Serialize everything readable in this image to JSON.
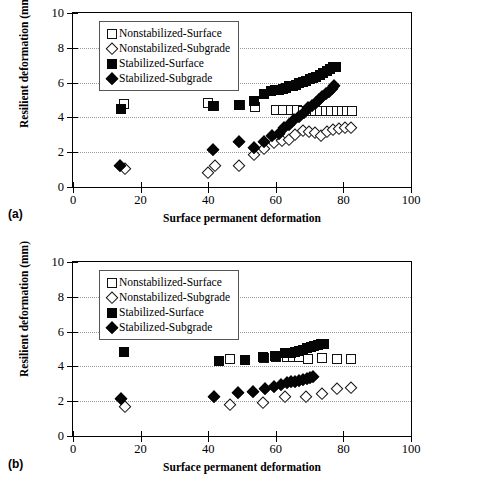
{
  "figure": {
    "panels": [
      {
        "letter": "(a)",
        "xlabel": "Surface permanent deformation",
        "ylabel": "Resilient deformation (mm)",
        "xticks": [
          "0",
          "20",
          "40",
          "60",
          "80",
          "100"
        ],
        "yticks": [
          "0",
          "2",
          "4",
          "6",
          "8",
          "10"
        ],
        "legend": [
          {
            "label": "Nonstabilized-Surface",
            "marker": "open-square-icon"
          },
          {
            "label": "Nonstabilized-Subgrade",
            "marker": "open-diamond-icon"
          },
          {
            "label": "Stabilized-Surface",
            "marker": "filled-square-icon"
          },
          {
            "label": "Stabilized-Subgrade",
            "marker": "filled-diamond-icon"
          }
        ]
      },
      {
        "letter": "(b)",
        "xlabel": "Surface permanent deformation",
        "ylabel": "Resilient deformation (mm)",
        "xticks": [
          "0",
          "20",
          "40",
          "60",
          "80",
          "100"
        ],
        "yticks": [
          "0",
          "2",
          "4",
          "6",
          "8",
          "10"
        ],
        "legend": [
          {
            "label": "Nonstabilized-Surface",
            "marker": "open-square-icon"
          },
          {
            "label": "Nonstabilized-Subgrade",
            "marker": "open-diamond-icon"
          },
          {
            "label": "Stabilized-Surface",
            "marker": "filled-square-icon"
          },
          {
            "label": "Stabilized-Subgrade",
            "marker": "filled-diamond-icon"
          }
        ]
      }
    ]
  },
  "chart_data": [
    {
      "type": "scatter",
      "panel": "(a)",
      "title": "",
      "xlabel": "Surface permanent deformation",
      "ylabel": "Resilient deformation (mm)",
      "xlim": [
        0,
        100
      ],
      "ylim": [
        0,
        10
      ],
      "xticks": [
        0,
        20,
        40,
        60,
        80,
        100
      ],
      "yticks": [
        0,
        2,
        4,
        6,
        8,
        10
      ],
      "grid": "horizontal-dotted",
      "legend_position": "upper-left-inside",
      "series": [
        {
          "name": "Nonstabilized-Surface",
          "marker": "open-square",
          "points": [
            [
              15.2,
              4.75
            ],
            [
              40.0,
              4.85
            ],
            [
              41.8,
              4.68
            ],
            [
              49.5,
              4.7
            ],
            [
              53.8,
              4.62
            ],
            [
              60.0,
              4.42
            ],
            [
              62.2,
              4.42
            ],
            [
              64.4,
              4.4
            ],
            [
              66.2,
              4.4
            ],
            [
              68.0,
              4.38
            ],
            [
              69.8,
              4.35
            ],
            [
              71.5,
              4.34
            ],
            [
              73.2,
              4.36
            ],
            [
              74.8,
              4.38
            ],
            [
              76.4,
              4.38
            ],
            [
              78.0,
              4.38
            ],
            [
              79.6,
              4.38
            ],
            [
              81.2,
              4.38
            ],
            [
              82.5,
              4.36
            ]
          ]
        },
        {
          "name": "Nonstabilized-Subgrade",
          "marker": "open-diamond",
          "points": [
            [
              15.5,
              1.05
            ],
            [
              40.0,
              0.78
            ],
            [
              42.0,
              1.18
            ],
            [
              49.2,
              1.18
            ],
            [
              53.5,
              1.85
            ],
            [
              56.5,
              2.18
            ],
            [
              59.5,
              2.55
            ],
            [
              61.8,
              2.62
            ],
            [
              63.8,
              2.68
            ],
            [
              65.8,
              3.0
            ],
            [
              68.0,
              3.22
            ],
            [
              69.8,
              3.18
            ],
            [
              71.6,
              3.1
            ],
            [
              73.4,
              2.95
            ],
            [
              75.2,
              3.18
            ],
            [
              77.0,
              3.25
            ],
            [
              78.8,
              3.35
            ],
            [
              80.6,
              3.38
            ],
            [
              82.2,
              3.38
            ]
          ]
        },
        {
          "name": "Stabilized-Surface",
          "marker": "filled-square",
          "points": [
            [
              14.2,
              4.5
            ],
            [
              41.5,
              4.68
            ],
            [
              49.0,
              4.7
            ],
            [
              53.5,
              4.92
            ],
            [
              56.5,
              5.35
            ],
            [
              58.5,
              5.5
            ],
            [
              59.8,
              5.55
            ],
            [
              61.0,
              5.6
            ],
            [
              62.0,
              5.65
            ],
            [
              63.0,
              5.7
            ],
            [
              64.0,
              5.78
            ],
            [
              65.0,
              5.82
            ],
            [
              66.0,
              5.88
            ],
            [
              67.0,
              5.95
            ],
            [
              68.0,
              6.02
            ],
            [
              69.0,
              6.1
            ],
            [
              70.0,
              6.18
            ],
            [
              71.0,
              6.25
            ],
            [
              72.0,
              6.35
            ],
            [
              73.0,
              6.45
            ],
            [
              74.0,
              6.55
            ],
            [
              75.0,
              6.65
            ],
            [
              76.0,
              6.78
            ],
            [
              77.0,
              6.88
            ],
            [
              77.8,
              6.92
            ]
          ]
        },
        {
          "name": "Stabilized-Subgrade",
          "marker": "filled-diamond",
          "points": [
            [
              14.0,
              1.22
            ],
            [
              41.5,
              2.12
            ],
            [
              49.0,
              2.6
            ],
            [
              53.5,
              2.22
            ],
            [
              56.5,
              2.58
            ],
            [
              58.8,
              2.95
            ],
            [
              60.8,
              3.05
            ],
            [
              62.5,
              3.38
            ],
            [
              64.0,
              3.55
            ],
            [
              65.5,
              3.85
            ],
            [
              67.0,
              4.02
            ],
            [
              68.2,
              4.28
            ],
            [
              69.4,
              4.55
            ],
            [
              70.6,
              4.68
            ],
            [
              71.8,
              4.85
            ],
            [
              72.8,
              5.02
            ],
            [
              73.8,
              5.18
            ],
            [
              74.8,
              5.35
            ],
            [
              75.8,
              5.48
            ],
            [
              76.6,
              5.62
            ],
            [
              77.2,
              5.82
            ]
          ]
        }
      ]
    },
    {
      "type": "scatter",
      "panel": "(b)",
      "title": "",
      "xlabel": "Surface permanent deformation",
      "ylabel": "Resilient deformation (mm)",
      "xlim": [
        0,
        100
      ],
      "ylim": [
        0,
        10
      ],
      "xticks": [
        0,
        20,
        40,
        60,
        80,
        100
      ],
      "yticks": [
        0,
        2,
        4,
        6,
        8,
        10
      ],
      "grid": "horizontal-dotted",
      "legend_position": "upper-left-inside",
      "series": [
        {
          "name": "Nonstabilized-Surface",
          "marker": "open-square",
          "points": [
            [
              46.5,
              4.42
            ],
            [
              56.5,
              4.48
            ],
            [
              60.0,
              4.52
            ],
            [
              63.2,
              4.55
            ],
            [
              65.0,
              4.55
            ],
            [
              66.8,
              4.52
            ],
            [
              69.5,
              4.45
            ],
            [
              73.8,
              4.48
            ],
            [
              78.2,
              4.45
            ],
            [
              82.2,
              4.42
            ]
          ]
        },
        {
          "name": "Nonstabilized-Subgrade",
          "marker": "open-diamond",
          "points": [
            [
              15.4,
              1.66
            ],
            [
              46.5,
              1.8
            ],
            [
              56.2,
              1.92
            ],
            [
              62.8,
              2.22
            ],
            [
              69.0,
              2.22
            ],
            [
              73.6,
              2.42
            ],
            [
              78.2,
              2.7
            ],
            [
              82.2,
              2.78
            ]
          ]
        },
        {
          "name": "Stabilized-Surface",
          "marker": "filled-square",
          "points": [
            [
              15.0,
              4.82
            ],
            [
              43.3,
              4.32
            ],
            [
              51.0,
              4.35
            ],
            [
              56.2,
              4.52
            ],
            [
              59.8,
              4.62
            ],
            [
              62.8,
              4.75
            ],
            [
              64.4,
              4.78
            ],
            [
              65.6,
              4.82
            ],
            [
              66.8,
              4.88
            ],
            [
              68.0,
              4.95
            ],
            [
              69.2,
              5.05
            ],
            [
              70.4,
              5.12
            ],
            [
              71.4,
              5.18
            ],
            [
              72.4,
              5.25
            ],
            [
              73.4,
              5.28
            ],
            [
              74.2,
              5.3
            ]
          ]
        },
        {
          "name": "Stabilized-Subgrade",
          "marker": "filled-diamond",
          "points": [
            [
              14.2,
              2.1
            ],
            [
              41.6,
              2.22
            ],
            [
              48.8,
              2.45
            ],
            [
              53.4,
              2.55
            ],
            [
              56.8,
              2.68
            ],
            [
              59.6,
              2.8
            ],
            [
              61.6,
              2.95
            ],
            [
              63.2,
              3.05
            ],
            [
              64.4,
              3.08
            ],
            [
              65.6,
              3.12
            ],
            [
              66.8,
              3.18
            ],
            [
              68.0,
              3.22
            ],
            [
              69.2,
              3.28
            ],
            [
              70.2,
              3.35
            ],
            [
              71.0,
              3.38
            ]
          ]
        }
      ]
    }
  ]
}
